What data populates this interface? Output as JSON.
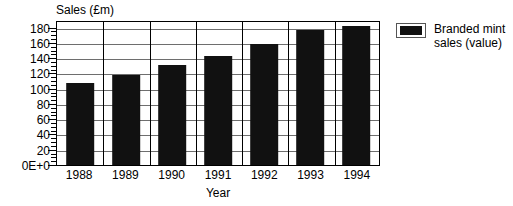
{
  "chart_data": {
    "type": "bar",
    "title": "",
    "xlabel": "Year",
    "ylabel": "Sales (£m)",
    "categories": [
      "1988",
      "1989",
      "1990",
      "1991",
      "1992",
      "1993",
      "1994"
    ],
    "values": [
      107,
      118,
      131,
      143,
      159,
      177,
      182
    ],
    "series": [
      {
        "name": "Branded mint sales (value)",
        "values": [
          107,
          118,
          131,
          143,
          159,
          177,
          182
        ],
        "color": "#111111"
      }
    ],
    "ylim": [
      0,
      190
    ],
    "ytick_values": [
      0,
      20,
      40,
      60,
      80,
      100,
      120,
      140,
      160,
      180
    ],
    "ytick_labels": [
      "0E+0",
      "20",
      "40",
      "60",
      "80",
      "100",
      "120",
      "140",
      "160",
      "180"
    ],
    "minor_ticks_per_major": 4,
    "grid": "horizontal-and-vertical",
    "legend_position": "right"
  },
  "legend": {
    "entries": [
      {
        "swatch_icon": "filled-square-icon",
        "line1": "Branded mint",
        "line2": "sales (value)"
      }
    ]
  }
}
